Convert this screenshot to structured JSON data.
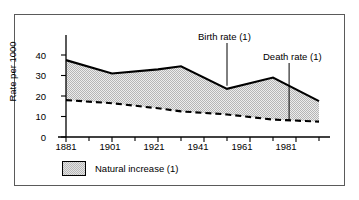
{
  "chart_data": {
    "type": "area",
    "title": "",
    "xlabel": "",
    "ylabel": "Rate per 1000",
    "xlim": [
      1881,
      1991
    ],
    "ylim": [
      0,
      45
    ],
    "yticks": [
      0,
      10,
      20,
      30,
      40
    ],
    "ytick_labels": [
      "0",
      "10",
      "20",
      "30",
      "40"
    ],
    "xticks": [
      1881,
      1891,
      1901,
      1911,
      1921,
      1931,
      1941,
      1951,
      1961,
      1971,
      1981,
      1991
    ],
    "xtick_labels": [
      "1881",
      "",
      "1901",
      "",
      "1921",
      "",
      "1941",
      "",
      "1961",
      "",
      "1981",
      ""
    ],
    "xtick_major": [
      1881,
      1901,
      1921,
      1941,
      1961,
      1981
    ],
    "grid": false,
    "legend_position": "below-axis-left",
    "x": [
      1881,
      1901,
      1921,
      1931,
      1951,
      1971,
      1991
    ],
    "series": [
      {
        "name": "Birth rate (1)",
        "style": "solid",
        "values": [
          37.5,
          31.0,
          33.0,
          34.5,
          23.5,
          29.0,
          17.5
        ]
      },
      {
        "name": "Death rate (1)",
        "style": "dashed",
        "values": [
          18.0,
          16.5,
          14.0,
          12.5,
          11.0,
          8.5,
          7.5
        ]
      }
    ],
    "fill_between": {
      "label": "Natural increase (1)",
      "upper_series": "Birth rate (1)",
      "lower_series": "Death rate (1)",
      "pattern": "stipple",
      "color": "#e3e3e3"
    },
    "annotations": [
      {
        "text": "Birth rate (1)",
        "points_to_year": 1951,
        "points_to_value": 25.0
      },
      {
        "text": "Death rate (1)",
        "points_to_year": 1978,
        "points_to_value": 8.0
      }
    ]
  },
  "axis": {
    "y_title": "Rate per 1000",
    "y_labels": [
      "40",
      "30",
      "20",
      "10",
      "0"
    ],
    "x_labels": [
      "1881",
      "1901",
      "1921",
      "1941",
      "1961",
      "1981"
    ]
  },
  "annotations": {
    "birth": "Birth rate (1)",
    "death": "Death rate (1)"
  },
  "legend": {
    "label": "Natural increase (1)"
  }
}
